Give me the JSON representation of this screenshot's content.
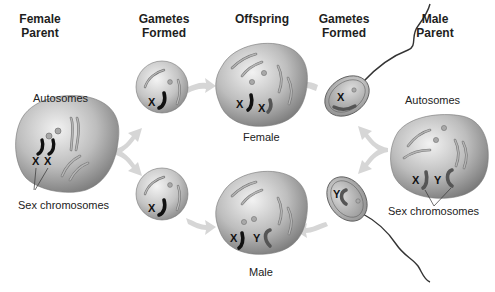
{
  "headers": {
    "female_parent": "Female\nParent",
    "gametes_left": "Gametes\nFormed",
    "offspring": "Offspring",
    "gametes_right": "Gametes\nFormed",
    "male_parent": "Male\nParent"
  },
  "female_parent": {
    "autosomes_label": "Autosomes",
    "sex_chromosomes_label": "Sex chromosomes",
    "sex_chromosomes": [
      "X",
      "X"
    ]
  },
  "egg_top": {
    "chromosome": "X"
  },
  "egg_bottom": {
    "chromosome": "X"
  },
  "offspring_female": {
    "label": "Female",
    "chromosomes": [
      "X",
      "X"
    ]
  },
  "offspring_male": {
    "label": "Male",
    "chromosomes": [
      "X",
      "Y"
    ]
  },
  "sperm_top": {
    "chromosome": "X"
  },
  "sperm_bottom": {
    "chromosome": "Y"
  },
  "male_parent": {
    "autosomes_label": "Autosomes",
    "sex_chromosomes_label": "Sex chromosomes",
    "sex_chromosomes": [
      "X",
      "Y"
    ]
  },
  "colors": {
    "cell_light": "#eeeeee",
    "cell_dark": "#8a8a8a",
    "arrow": "#d4d4d4",
    "chromosome_black": "#111111",
    "chromosome_grey": "#6a6a6a"
  }
}
